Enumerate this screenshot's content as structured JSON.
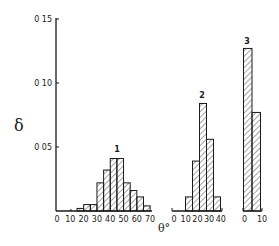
{
  "chart_data": {
    "type": "bar",
    "title": "",
    "ylabel": "δ",
    "xlabel": "θ°",
    "ylim": [
      0,
      0.15
    ],
    "yticks": [
      {
        "value": 0.05,
        "label": "0 05"
      },
      {
        "value": 0.1,
        "label": "0 10"
      },
      {
        "value": 0.15,
        "label": "0 15"
      }
    ],
    "grid": false,
    "legend": "none",
    "series": [
      {
        "name": "1",
        "xticks": [
          "0",
          "10",
          "20",
          "30",
          "40",
          "50",
          "60",
          "70"
        ],
        "xrange": [
          0,
          70
        ],
        "bins": [
          "15-20",
          "20-25",
          "25-30",
          "30-35",
          "35-40",
          "40-45",
          "45-50",
          "50-55",
          "55-60",
          "60-65",
          "65-70"
        ],
        "values": [
          0.002,
          0.005,
          0.005,
          0.022,
          0.032,
          0.041,
          0.041,
          0.022,
          0.016,
          0.011,
          0.004
        ]
      },
      {
        "name": "2",
        "xticks": [
          "0",
          "10",
          "20",
          "30",
          "40"
        ],
        "xrange": [
          0,
          40
        ],
        "bins": [
          "10-16",
          "16-22",
          "22-28",
          "28-34",
          "34-40"
        ],
        "values": [
          0.011,
          0.039,
          0.084,
          0.056,
          0.011
        ]
      },
      {
        "name": "3",
        "xticks": [
          "0",
          "10"
        ],
        "xrange": [
          0,
          10
        ],
        "bins": [
          "0-5",
          "5-10"
        ],
        "values": [
          0.127,
          0.077
        ]
      }
    ]
  },
  "labels": {
    "y_axis": "δ",
    "x_axis": "θ°",
    "hist1": "1",
    "hist2": "2",
    "hist3": "3"
  },
  "colors": {
    "ink": "#1a1a1a",
    "background": "#ffffff"
  }
}
